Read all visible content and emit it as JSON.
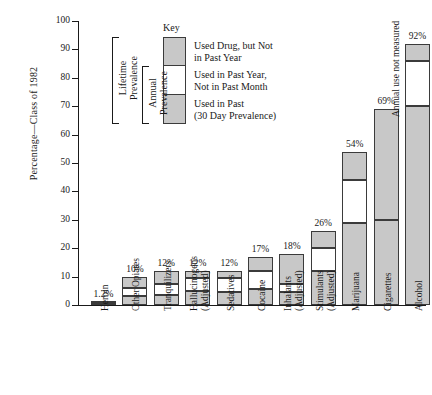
{
  "chart_data": {
    "type": "bar",
    "subtype": "stacked-bar",
    "title": "",
    "xlabel": "",
    "ylabel": "Percentage—Class of 1982",
    "ylim": [
      0,
      100
    ],
    "yticks": [
      0,
      10,
      20,
      30,
      40,
      50,
      60,
      70,
      80,
      90,
      100
    ],
    "grid": false,
    "legend_position": "inside-upper-left",
    "categories": [
      "Heroin",
      "Other Opiates",
      "Tranquilizers",
      "Hallucinogens\n(Adjusted)",
      "Sedatives",
      "Cocaine",
      "Inhalants\n(Adjusted)",
      "Stimulants\n(Adjusted)",
      "Marijuana",
      "Cigarettes",
      "Alcohol"
    ],
    "series": [
      {
        "name": "Used in Past (30 Day Prevalence)",
        "color": "#c8c8c8",
        "values": [
          0.2,
          3,
          3.5,
          5,
          4.5,
          5.5,
          4.5,
          12,
          29,
          30,
          70
        ]
      },
      {
        "name": "Used in Past Year, Not in Past Month",
        "color": "#ffffff",
        "values": [
          0.4,
          3,
          4,
          4.5,
          5,
          6.5,
          3,
          8,
          15,
          null,
          16
        ]
      },
      {
        "name": "Used Drug, but Not in Past Year",
        "color": "#c8c8c8",
        "values": [
          0.6,
          4,
          4.5,
          2.5,
          2.5,
          5,
          10.5,
          6,
          10,
          39,
          6
        ]
      }
    ],
    "totals": [
      1.2,
      10,
      12,
      12,
      12,
      17,
      18,
      26,
      54,
      69,
      92
    ],
    "total_labels": [
      "1.2%",
      "10%",
      "12%",
      "12%",
      "12%",
      "17%",
      "18%",
      "26%",
      "54%",
      "69%",
      "92%"
    ],
    "annotations": [
      {
        "category": "Cigarettes",
        "text": "Annual use not measured",
        "orientation": "vertical"
      }
    ]
  },
  "key": {
    "title": "Key",
    "entries": [
      {
        "swatch": "gray",
        "label": "Used Drug, but Not\nin Past Year"
      },
      {
        "swatch": "white",
        "label": "Used in Past Year,\nNot in Past Month"
      },
      {
        "swatch": "gray",
        "label": "Used in Past\n(30 Day Prevalence)"
      }
    ],
    "brackets": [
      {
        "label": "Lifetime\nPrevalence",
        "spans": "all-three"
      },
      {
        "label": "Annual\nPrevalence",
        "spans": "lower-two"
      }
    ]
  },
  "colors": {
    "bar_gray": "#c8c8c8",
    "bar_white": "#ffffff",
    "bar_outline": "#3b3b3b",
    "axis": "#1a1a1a",
    "text": "#1a1a1a",
    "background": "#ffffff"
  }
}
